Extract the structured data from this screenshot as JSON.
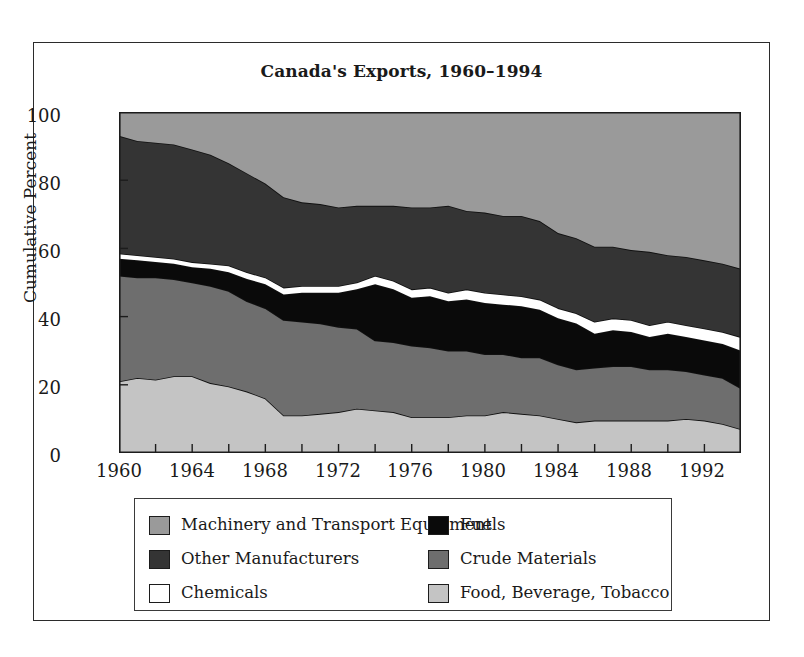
{
  "figure": {
    "title": "Canada's Exports, 1960–1994"
  },
  "axes": {
    "ylabel": "Cumulative Percent",
    "yticks": [
      "100",
      "80",
      "60",
      "40",
      "20",
      "0"
    ],
    "xticks": [
      "1960",
      "1964",
      "1968",
      "1972",
      "1976",
      "1980",
      "1984",
      "1988",
      "1992"
    ]
  },
  "legend": {
    "left": [
      {
        "label": "Machinery and Transport Equipment",
        "color": "#9a9a9a",
        "name": "machinery-and-transport-equipment"
      },
      {
        "label": "Other Manufacturers",
        "color": "#343434",
        "name": "other-manufacturers"
      },
      {
        "label": "Chemicals",
        "color": "#ffffff",
        "name": "chemicals"
      }
    ],
    "right": [
      {
        "label": "Fuels",
        "color": "#0a0a0a",
        "name": "fuels"
      },
      {
        "label": "Crude Materials",
        "color": "#6e6e6e",
        "name": "crude-materials"
      },
      {
        "label": "Food, Beverage, Tobacco",
        "color": "#c4c4c4",
        "name": "food-beverage-tobacco"
      }
    ]
  },
  "chart_data": {
    "type": "area",
    "stacked": true,
    "title": "Canada's Exports, 1960–1994",
    "xlabel": "",
    "ylabel": "Cumulative Percent",
    "ylim": [
      0,
      100
    ],
    "xlim": [
      1960,
      1994
    ],
    "grid": false,
    "legend_position": "below-plot",
    "tick_labels": {
      "x": [
        "1960",
        "1964",
        "1968",
        "1972",
        "1976",
        "1980",
        "1984",
        "1988",
        "1992"
      ],
      "y": [
        "0",
        "20",
        "40",
        "60",
        "80",
        "100"
      ]
    },
    "x": [
      1960,
      1961,
      1962,
      1963,
      1964,
      1965,
      1966,
      1967,
      1968,
      1969,
      1970,
      1971,
      1972,
      1973,
      1974,
      1975,
      1976,
      1977,
      1978,
      1979,
      1980,
      1981,
      1982,
      1983,
      1984,
      1985,
      1986,
      1987,
      1988,
      1989,
      1990,
      1991,
      1992,
      1993,
      1994
    ],
    "series": [
      {
        "name": "Food, Beverage, Tobacco",
        "color": "#c4c4c4",
        "stack_order": 1,
        "values": [
          21.0,
          22.0,
          21.5,
          22.5,
          22.5,
          20.5,
          19.5,
          18.0,
          16.0,
          11.0,
          11.0,
          11.5,
          12.0,
          13.0,
          12.5,
          12.0,
          10.5,
          10.5,
          10.5,
          11.0,
          11.0,
          12.0,
          11.5,
          11.0,
          10.0,
          9.0,
          9.5,
          9.5,
          9.5,
          9.5,
          9.5,
          10.0,
          9.5,
          8.5,
          7.0
        ]
      },
      {
        "name": "Crude Materials",
        "color": "#6e6e6e",
        "stack_order": 2,
        "values": [
          31.0,
          29.5,
          30.0,
          28.5,
          27.5,
          28.5,
          28.0,
          26.5,
          26.5,
          28.0,
          27.5,
          26.5,
          25.0,
          23.5,
          20.5,
          20.5,
          21.0,
          20.5,
          19.5,
          19.0,
          18.0,
          17.0,
          16.5,
          17.0,
          16.0,
          15.5,
          15.5,
          16.0,
          16.0,
          15.0,
          15.0,
          14.0,
          13.5,
          13.5,
          12.0
        ]
      },
      {
        "name": "Fuels",
        "color": "#0a0a0a",
        "stack_order": 3,
        "values": [
          5.0,
          5.0,
          4.5,
          4.5,
          4.5,
          5.0,
          5.5,
          6.5,
          7.0,
          7.5,
          8.5,
          9.0,
          10.0,
          11.5,
          16.5,
          15.5,
          14.0,
          15.0,
          14.5,
          15.0,
          15.0,
          14.5,
          15.0,
          14.0,
          13.5,
          13.5,
          10.0,
          10.5,
          10.0,
          9.5,
          10.5,
          10.0,
          10.0,
          10.0,
          11.0
        ]
      },
      {
        "name": "Chemicals",
        "color": "#ffffff",
        "stack_order": 4,
        "values": [
          1.5,
          1.5,
          1.5,
          1.5,
          1.5,
          1.5,
          2.0,
          2.0,
          2.0,
          2.0,
          2.0,
          2.0,
          2.0,
          2.0,
          2.5,
          2.5,
          2.5,
          2.5,
          2.5,
          3.0,
          3.0,
          3.0,
          3.0,
          3.0,
          3.0,
          3.0,
          3.5,
          3.5,
          3.5,
          3.5,
          3.5,
          3.5,
          3.5,
          3.5,
          4.0
        ]
      },
      {
        "name": "Other Manufacturers",
        "color": "#343434",
        "stack_order": 5,
        "values": [
          34.5,
          33.5,
          33.5,
          33.5,
          33.0,
          32.0,
          30.0,
          29.0,
          27.5,
          26.5,
          24.5,
          24.0,
          23.0,
          22.5,
          20.5,
          22.0,
          24.0,
          23.5,
          25.5,
          23.0,
          23.5,
          23.0,
          23.5,
          23.0,
          22.0,
          22.0,
          22.0,
          21.0,
          20.5,
          21.5,
          19.5,
          20.0,
          20.0,
          20.0,
          20.0
        ]
      },
      {
        "name": "Machinery and Transport Equipment",
        "color": "#9a9a9a",
        "stack_order": 6,
        "values": [
          7.0,
          8.5,
          9.0,
          9.5,
          11.0,
          12.5,
          15.0,
          18.0,
          21.0,
          25.0,
          26.5,
          27.0,
          28.0,
          27.5,
          27.5,
          27.5,
          28.0,
          28.0,
          27.5,
          29.0,
          29.5,
          30.5,
          30.5,
          32.0,
          35.5,
          37.0,
          39.5,
          39.5,
          40.5,
          41.0,
          42.0,
          42.5,
          43.5,
          44.5,
          46.0
        ]
      }
    ]
  }
}
